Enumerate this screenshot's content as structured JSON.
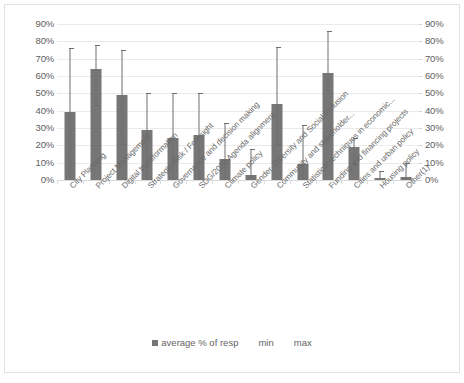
{
  "chart_data": {
    "type": "bar",
    "title": "",
    "xlabel": "",
    "ylabel": "",
    "ylim": [
      0,
      90
    ],
    "grid": true,
    "legend_position": "bottom",
    "dual_axis": true,
    "yticks": [
      "0%",
      "10%",
      "20%",
      "30%",
      "40%",
      "50%",
      "60%",
      "70%",
      "80%",
      "90%"
    ],
    "ytick_values": [
      0,
      10,
      20,
      30,
      40,
      50,
      60,
      70,
      80,
      90
    ],
    "categories": [
      "City Planning",
      "Project Management",
      "Digital transformation",
      "Strategic Risk / Foresight",
      "Governance and decision making",
      "SDG/2030 Agenda alignment",
      "Climate policy",
      "Gender, Diversity and Social Inclusion",
      "Community and stakeholder...",
      "Statistical techniques in economic...",
      "Funding and financing projects",
      "Cities and urban policy",
      "Housing policy",
      "Other(1)"
    ],
    "series": [
      {
        "name": "average % of resp",
        "type": "bar",
        "color": "#767676",
        "values": [
          39,
          64,
          49,
          29,
          24,
          26,
          12,
          3,
          44,
          9,
          62,
          19,
          1,
          2
        ]
      },
      {
        "name": "min",
        "type": "error-low",
        "color": "#6e6e6e",
        "values": [
          0,
          43,
          21,
          0,
          0,
          0,
          0,
          0,
          21,
          0,
          50,
          9,
          0,
          0
        ]
      },
      {
        "name": "max",
        "type": "error-high",
        "color": "#6e6e6e",
        "values": [
          76,
          78,
          75,
          50,
          50,
          50,
          33,
          18,
          77,
          32,
          86,
          24,
          5,
          10
        ]
      }
    ],
    "legend": [
      "average % of resp",
      "min",
      "max"
    ]
  },
  "caption": ""
}
